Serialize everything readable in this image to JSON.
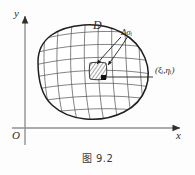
{
  "figure": {
    "caption": "图 9.2",
    "axes": {
      "y_label": "y",
      "x_label": "x",
      "origin_label": "O"
    },
    "annotations": {
      "region_label": "D",
      "subregion_label": "Δσᵢ",
      "sample_point_label": "(ξᵢ,ηᵢ)"
    },
    "colors": {
      "background": "#fdfdfd",
      "ink": "#2b2b2b",
      "axis": "#8c8c8c",
      "boundary": "#1f1f1f",
      "grid": "#5a5a5a",
      "hatch": "#3a3a3a"
    },
    "geometry": {
      "y_axis_x": 25,
      "x_axis_y": 128,
      "grid_u_lines": 8,
      "grid_v_lines": 8,
      "highlight_cell_center_x": 98,
      "highlight_cell_center_y": 72,
      "sample_point_x": 104,
      "sample_point_y": 78
    }
  }
}
